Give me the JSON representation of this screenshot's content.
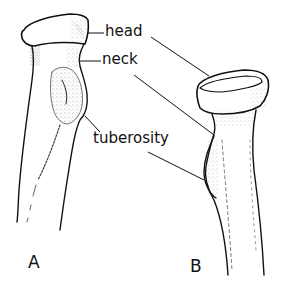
{
  "diagram": {
    "views": [
      {
        "id": "A",
        "label": "A"
      },
      {
        "id": "B",
        "label": "B"
      }
    ],
    "labels": {
      "head": "head",
      "neck": "neck",
      "tuberosity": "tuberosity"
    },
    "colors": {
      "line": "#111111",
      "background": "#ffffff",
      "stipple": "#333333"
    }
  }
}
